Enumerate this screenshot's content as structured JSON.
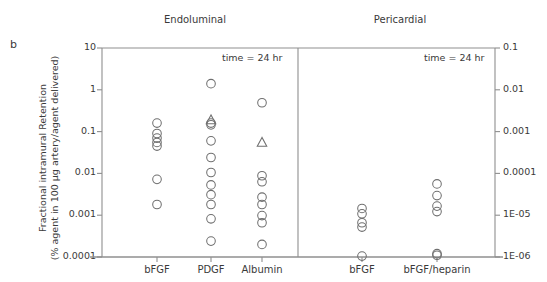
{
  "panel_label": "b",
  "axis_title_line1": "Fractional intramural Retention",
  "axis_title_line2": "(% agent in 100 µg artery/agent delivered)",
  "chart_data": {
    "type": "scatter",
    "title": "",
    "subtitle": "",
    "panel_label": "b",
    "ylabel": "Fractional intramural Retention (% agent in 100 µg artery/agent delivered)",
    "xlabel": "",
    "yscale": "log",
    "grid": false,
    "legend": "none",
    "panels": [
      {
        "name": "endoluminal",
        "title": "Endoluminal",
        "annotation": "time = 24 hr",
        "yaxis_side": "left",
        "ylim": [
          0.0001,
          10
        ],
        "yticks": [
          10,
          1,
          0.1,
          0.01,
          0.001,
          0.0001
        ],
        "ytick_labels": [
          "10",
          "1",
          "0.1",
          "0.01",
          "0.001",
          "0.0001"
        ],
        "categories": [
          "bFGF",
          "PDGF",
          "Albumin"
        ],
        "series": [
          {
            "name": "bFGF",
            "marker": "circle",
            "values": [
              0.16,
              0.09,
              0.07,
              0.055,
              0.045,
              0.0072,
              0.0018
            ]
          },
          {
            "name": "PDGF",
            "marker": "circle",
            "values": [
              1.4,
              0.16,
              0.145,
              0.06,
              0.024,
              0.0105,
              0.0053,
              0.0031,
              0.0018,
              0.00082,
              0.00024
            ]
          },
          {
            "name": "PDGF",
            "marker": "triangle",
            "values": [
              0.19
            ]
          },
          {
            "name": "Albumin",
            "marker": "circle",
            "values": [
              0.49,
              0.0088,
              0.0063,
              0.0027,
              0.0018,
              0.00098,
              0.00066,
              0.0002
            ]
          },
          {
            "name": "Albumin",
            "marker": "triangle",
            "values": [
              0.055
            ]
          }
        ]
      },
      {
        "name": "pericardial",
        "title": "Pericardial",
        "annotation": "time = 24 hr",
        "yaxis_side": "right",
        "ylim": [
          1e-06,
          0.1
        ],
        "yticks": [
          0.1,
          0.01,
          0.001,
          0.0001,
          1e-05,
          1e-06
        ],
        "ytick_labels": [
          "0.1",
          "0.01",
          "0.001",
          "0.0001",
          "1E-05",
          "1E-06"
        ],
        "categories": [
          "bFGF",
          "bFGF/heparin"
        ],
        "series": [
          {
            "name": "bFGF",
            "marker": "circle",
            "values": [
              1.45e-05,
              1.08e-05,
              6.6e-06,
              5.2e-06,
              1.05e-06
            ]
          },
          {
            "name": "bFGF/heparin",
            "marker": "circle",
            "values": [
              5.6e-05,
              2.95e-05,
              1.65e-05,
              1.22e-05,
              1.2e-06,
              1.1e-06
            ]
          }
        ]
      }
    ]
  }
}
